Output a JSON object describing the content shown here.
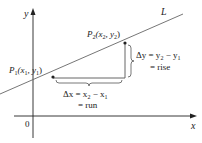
{
  "diagram": {
    "axes": {
      "x_label": "x",
      "y_label": "y",
      "origin_label": "0"
    },
    "line": {
      "label": "L"
    },
    "points": {
      "p1": {
        "name": "P",
        "sub": "1",
        "coords_text": "(x",
        "coords_sub1": "1",
        "coords_mid": ", y",
        "coords_sub2": "1",
        "coords_end": ")"
      },
      "p2": {
        "name": "P",
        "sub": "2",
        "coords_text": "(x",
        "coords_sub1": "2",
        "coords_mid": ", y",
        "coords_sub2": "2",
        "coords_end": ")"
      }
    },
    "delta_x": {
      "line1_prefix": "Δx = x",
      "line1_sub_a": "2",
      "line1_mid": " − x",
      "line1_sub_b": "1",
      "line2": "= run"
    },
    "delta_y": {
      "line1_prefix": "Δy = y",
      "line1_sub_a": "2",
      "line1_mid": " − y",
      "line1_sub_b": "1",
      "line2": "= rise"
    },
    "colors": {
      "axis": "#222222",
      "line": "#555555",
      "text": "#222222"
    }
  }
}
